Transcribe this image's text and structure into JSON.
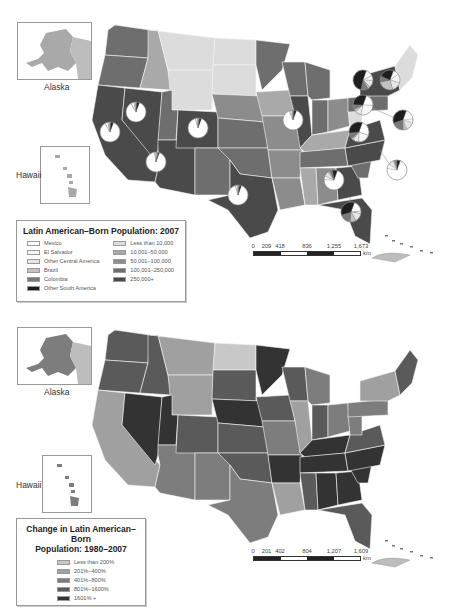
{
  "colors": {
    "pop_less_10k": "#dcdcdc",
    "pop_10k_50k": "#a9a9a9",
    "pop_50k_100k": "#8c8c8c",
    "pop_100k_250k": "#6e6e6e",
    "pop_250k_plus": "#4a4a4a",
    "pie_mexico": "#ffffff",
    "pie_el_salvador": "#f7f7f7",
    "pie_other_central_america": "#e6e6e6",
    "pie_brazil": "#c2c2c2",
    "pie_colombia": "#7a7a7a",
    "pie_other_south_america": "#1e1e1e",
    "chg_less_200": "#c8c8c8",
    "chg_201_400": "#a0a0a0",
    "chg_401_800": "#7d7d7d",
    "chg_801_1600": "#5a5a5a",
    "chg_1601_plus": "#333333"
  },
  "top_map": {
    "insets": {
      "alaska_label": "Alaska",
      "hawaii_label": "Hawaii"
    },
    "legend": {
      "title": "Latin American–Born Population: 2007",
      "origin_items": [
        {
          "label": "Mexico",
          "color_key": "pie_mexico"
        },
        {
          "label": "El Salvador",
          "color_key": "pie_el_salvador"
        },
        {
          "label": "Other Central America",
          "color_key": "pie_other_central_america"
        },
        {
          "label": "Brazil",
          "color_key": "pie_brazil"
        },
        {
          "label": "Colombia",
          "color_key": "pie_colombia"
        },
        {
          "label": "Other South America",
          "color_key": "pie_other_south_america"
        }
      ],
      "population_items": [
        {
          "label": "Less than 10,000",
          "color_key": "pop_less_10k"
        },
        {
          "label": "10,001–50,000",
          "color_key": "pop_10k_50k"
        },
        {
          "label": "50,001–100,000",
          "color_key": "pop_50k_100k"
        },
        {
          "label": "100,001–250,000",
          "color_key": "pop_100k_250k"
        },
        {
          "label": "250,000+",
          "color_key": "pop_250k_plus"
        }
      ]
    },
    "scale": {
      "ticks": [
        "0",
        "209",
        "418",
        "836",
        "1,255",
        "1,673"
      ],
      "unit": "km"
    },
    "pies": [
      {
        "state": "California",
        "shares": [
          0.86,
          0.05,
          0.03,
          0.01,
          0.01,
          0.04
        ]
      },
      {
        "state": "Nevada",
        "shares": [
          0.86,
          0.05,
          0.03,
          0.01,
          0.01,
          0.04
        ]
      },
      {
        "state": "Arizona",
        "shares": [
          0.92,
          0.02,
          0.02,
          0.01,
          0.01,
          0.02
        ]
      },
      {
        "state": "Colorado",
        "shares": [
          0.9,
          0.03,
          0.02,
          0.01,
          0.01,
          0.03
        ]
      },
      {
        "state": "Texas",
        "shares": [
          0.9,
          0.03,
          0.02,
          0.01,
          0.01,
          0.03
        ]
      },
      {
        "state": "Illinois",
        "shares": [
          0.88,
          0.02,
          0.03,
          0.01,
          0.02,
          0.04
        ]
      },
      {
        "state": "Georgia",
        "shares": [
          0.7,
          0.06,
          0.08,
          0.03,
          0.05,
          0.08
        ]
      },
      {
        "state": "North Carolina",
        "shares": [
          0.72,
          0.08,
          0.08,
          0.02,
          0.04,
          0.06
        ]
      },
      {
        "state": "Virginia",
        "shares": [
          0.25,
          0.2,
          0.1,
          0.03,
          0.1,
          0.32
        ]
      },
      {
        "state": "Maryland",
        "shares": [
          0.2,
          0.28,
          0.1,
          0.04,
          0.08,
          0.3
        ]
      },
      {
        "state": "New York",
        "shares": [
          0.12,
          0.08,
          0.12,
          0.04,
          0.12,
          0.52
        ]
      },
      {
        "state": "Massachusetts",
        "shares": [
          0.1,
          0.14,
          0.16,
          0.26,
          0.1,
          0.24
        ]
      },
      {
        "state": "New Jersey",
        "shares": [
          0.18,
          0.06,
          0.14,
          0.06,
          0.2,
          0.36
        ]
      },
      {
        "state": "Florida",
        "shares": [
          0.18,
          0.04,
          0.14,
          0.1,
          0.18,
          0.36
        ]
      }
    ]
  },
  "bottom_map": {
    "insets": {
      "alaska_label": "Alaska",
      "hawaii_label": "Hawaii"
    },
    "legend": {
      "title_line1": "Change in Latin American–Born",
      "title_line2": "Population: 1980–2007",
      "items": [
        {
          "label": "Less than 200%",
          "color_key": "chg_less_200"
        },
        {
          "label": "201%–400%",
          "color_key": "chg_201_400"
        },
        {
          "label": "401%–800%",
          "color_key": "chg_401_800"
        },
        {
          "label": "801%–1600%",
          "color_key": "chg_801_1600"
        },
        {
          "label": "1601% +",
          "color_key": "chg_1601_plus"
        }
      ]
    },
    "scale": {
      "ticks": [
        "0",
        "201",
        "402",
        "804",
        "1,207",
        "1,609"
      ],
      "unit": "km"
    }
  },
  "states_top": {
    "WA": "pop_100k_250k",
    "OR": "pop_100k_250k",
    "CA": "pop_250k_plus",
    "NV": "pop_250k_plus",
    "ID": "pop_10k_50k",
    "MT": "pop_less_10k",
    "WY": "pop_less_10k",
    "UT": "pop_100k_250k",
    "AZ": "pop_250k_plus",
    "CO": "pop_250k_plus",
    "NM": "pop_100k_250k",
    "ND": "pop_less_10k",
    "SD": "pop_less_10k",
    "NE": "pop_50k_100k",
    "KS": "pop_100k_250k",
    "OK": "pop_100k_250k",
    "TX": "pop_250k_plus",
    "MN": "pop_100k_250k",
    "IA": "pop_10k_50k",
    "MO": "pop_50k_100k",
    "AR": "pop_50k_100k",
    "LA": "pop_50k_100k",
    "WI": "pop_100k_250k",
    "IL": "pop_250k_plus",
    "MI": "pop_100k_250k",
    "IN": "pop_100k_250k",
    "OH": "pop_50k_100k",
    "KY": "pop_10k_50k",
    "TN": "pop_100k_250k",
    "MS": "pop_10k_50k",
    "AL": "pop_50k_100k",
    "GA": "pop_250k_plus",
    "FL": "pop_250k_plus",
    "SC": "pop_100k_250k",
    "NC": "pop_250k_plus",
    "VA": "pop_250k_plus",
    "WV": "pop_less_10k",
    "PA": "pop_100k_250k",
    "NY": "pop_250k_plus",
    "NE_NEW": "pop_less_10k",
    "AK": "pop_10k_50k",
    "HI": "pop_10k_50k"
  },
  "states_bottom": {
    "WA": "chg_801_1600",
    "OR": "chg_801_1600",
    "CA": "chg_201_400",
    "NV": "chg_1601_plus",
    "ID": "chg_801_1600",
    "MT": "chg_201_400",
    "WY": "chg_201_400",
    "UT": "chg_1601_plus",
    "AZ": "chg_401_800",
    "CO": "chg_801_1600",
    "NM": "chg_401_800",
    "ND": "chg_less_200",
    "SD": "chg_801_1600",
    "NE": "chg_1601_plus",
    "KS": "chg_801_1600",
    "OK": "chg_801_1600",
    "TX": "chg_401_800",
    "MN": "chg_1601_plus",
    "IA": "chg_801_1600",
    "MO": "chg_401_800",
    "AR": "chg_1601_plus",
    "LA": "chg_201_400",
    "WI": "chg_801_1600",
    "IL": "chg_201_400",
    "MI": "chg_401_800",
    "IN": "chg_801_1600",
    "OH": "chg_401_800",
    "KY": "chg_1601_plus",
    "TN": "chg_1601_plus",
    "MS": "chg_801_1600",
    "AL": "chg_1601_plus",
    "GA": "chg_1601_plus",
    "FL": "chg_801_1600",
    "SC": "chg_1601_plus",
    "NC": "chg_1601_plus",
    "VA": "chg_801_1600",
    "WV": "chg_401_800",
    "PA": "chg_401_800",
    "NY": "chg_201_400",
    "NE_NEW": "chg_801_1600",
    "AK": "chg_401_800",
    "HI": "chg_401_800"
  }
}
